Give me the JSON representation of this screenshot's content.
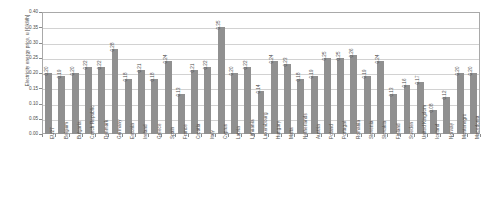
{
  "chart_data": {
    "type": "bar",
    "title": "",
    "xlabel": "",
    "ylabel": "Electricity energy price, u [€/kWh]",
    "ylim": [
      0.0,
      0.4
    ],
    "ytick_labels": [
      "0.40",
      "0.35",
      "0.30",
      "0.25",
      "0.20",
      "0.15",
      "0.10",
      "0.05",
      "0.00"
    ],
    "ytick_values": [
      0.4,
      0.35,
      0.3,
      0.25,
      0.2,
      0.15,
      0.1,
      0.05,
      0.0
    ],
    "grid": true,
    "legend": "none",
    "bar_color": "#909090",
    "categories": [
      "EU27",
      "Belgium",
      "Bulgaria",
      "Czech Republic",
      "Denmark",
      "Germany",
      "Estonia",
      "Ireland",
      "Greece",
      "Spain",
      "France",
      "Croatia",
      "Italy",
      "Cyprus",
      "Latvia",
      "Lithuania",
      "Luxembourg",
      "Hungary",
      "Malta",
      "Netherlands",
      "Austria",
      "Poland",
      "Portugal",
      "Romania",
      "Slovenia",
      "Slovakia",
      "Finland",
      "Sweden",
      "United Kingdom",
      "Iceland",
      "Norway",
      "Montenegro",
      "Macedonia"
    ],
    "values": [
      0.2,
      0.19,
      0.2,
      0.22,
      0.22,
      0.28,
      0.18,
      0.21,
      0.18,
      0.24,
      0.13,
      0.21,
      0.22,
      0.35,
      0.2,
      0.22,
      0.14,
      0.24,
      0.23,
      0.18,
      0.19,
      0.25,
      0.25,
      0.26,
      0.19,
      0.24,
      0.13,
      0.16,
      0.17,
      0.08,
      0.12,
      0.2,
      0.2
    ],
    "value_labels": [
      "0.20",
      "0.19",
      "0.20",
      "0.22",
      "0.22",
      "0.28",
      "0.18",
      "0.21",
      "0.18",
      "0.24",
      "0.13",
      "0.21",
      "0.22",
      "0.35",
      "0.20",
      "0.22",
      "0.14",
      "0.24",
      "0.23",
      "0.18",
      "0.19",
      "0.25",
      "0.25",
      "0.26",
      "0.19",
      "0.24",
      "0.13",
      "0.16",
      "0.17",
      "0.08",
      "0.12",
      "0.20",
      "0.20"
    ]
  }
}
